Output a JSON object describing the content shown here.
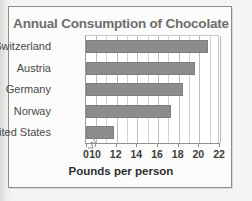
{
  "chart_data": {
    "type": "bar",
    "orientation": "horizontal",
    "title": "Annual Consumption of Chocolate",
    "xlabel": "Pounds per person",
    "ylabel": "",
    "categories": [
      "Switzerland",
      "Austria",
      "Germany",
      "Norway",
      "United States"
    ],
    "values": [
      20.8,
      19.6,
      18.4,
      17.3,
      11.7
    ],
    "xlim": [
      10,
      22
    ],
    "axis_break": true,
    "axis_break_note": "x-axis broken between 0 and 10",
    "xticks": [
      0,
      10,
      12,
      14,
      16,
      18,
      20,
      22
    ],
    "xtick_labels": [
      "0",
      "10",
      "12",
      "14",
      "16",
      "18",
      "20",
      "22"
    ],
    "gridline_step": 1,
    "grid": true,
    "legend": false,
    "legend_position": "none"
  },
  "style": {
    "bar_color": "#8c8c8c",
    "bar_border_color": "#7d7d7d",
    "title_color": "#6e6e6e",
    "grid_color": "#d2d2d2",
    "axis_color": "#8f8f8f",
    "plot_background": "#ffffff",
    "figure_background": "#fbfbfa",
    "page_background": "#f4f4f2"
  },
  "icons": {
    "axis_break": "axis-break-zigzag"
  }
}
